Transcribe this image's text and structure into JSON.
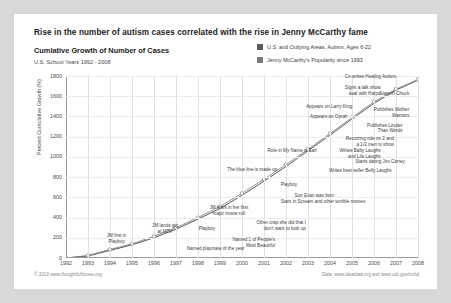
{
  "header": {
    "title": "Rise in the number of autism cases correlated with the rise in Jenny McCarthy fame",
    "subtitle": "Cumlative Growth of Number of Cases",
    "subsubtitle": "U.S. School Years 1992 - 2008"
  },
  "footer": {
    "left": "© 2013 www.thoughtfulhouse.org",
    "right": "Data: www.ideadata.org and www.cdc.gov/ncbd"
  },
  "colors": {
    "series_autism": "#5a5a5a",
    "series_mccarthy": "#7a7a7a",
    "grid": "#e2e2e2",
    "axis": "#9a9a9a",
    "card": "#ffffff",
    "page": "#d8d8d8",
    "text": "#1b1b1b"
  },
  "chart_data": {
    "type": "line",
    "title": "Rise in the number of autism cases correlated with the rise in Jenny McCarthy fame",
    "xlabel": "",
    "ylabel": "Percent Cumulative Growth (%)",
    "xlim": [
      1992,
      2008
    ],
    "ylim": [
      0,
      1800
    ],
    "yticks": [
      0,
      200,
      400,
      600,
      800,
      1000,
      1200,
      1400,
      1600,
      1800
    ],
    "ytick_labels": [
      "0",
      "200",
      "400",
      "600",
      "800",
      "1000",
      "1200",
      "1400",
      "1600",
      "1800"
    ],
    "grid": true,
    "legend_position": "top-right",
    "x": [
      1992,
      1993,
      1994,
      1995,
      1996,
      1997,
      1998,
      1999,
      2000,
      2001,
      2002,
      2003,
      2004,
      2005,
      2006,
      2007,
      2008
    ],
    "series": [
      {
        "name": "U.S. and Outlying  Areas, Autism, Ages 6-22",
        "values": [
          0,
          20,
          75,
          130,
          200,
          285,
          385,
          490,
          620,
          760,
          905,
          1060,
          1215,
          1375,
          1530,
          1660,
          1760
        ]
      },
      {
        "name": "Jenny McCarthy's Popularity since 1993",
        "values": [
          0,
          25,
          85,
          140,
          215,
          300,
          400,
          510,
          640,
          780,
          925,
          1075,
          1230,
          1390,
          1545,
          1670,
          1765
        ]
      }
    ],
    "annotations": [
      {
        "text": "Co-writes Healing Autism",
        "x": 2007.0,
        "y": 1775
      },
      {
        "text": "Signs a talk show\ndeal with Harpo",
        "x": 2006.3,
        "y": 1660
      },
      {
        "text": "Stars in Chuck",
        "x": 2007.6,
        "y": 1600
      },
      {
        "text": "Appears on Larry King",
        "x": 2005.0,
        "y": 1470
      },
      {
        "text": "Publishes Mother\nWarriors",
        "x": 2007.6,
        "y": 1440
      },
      {
        "text": "Appears on Oprah",
        "x": 2004.8,
        "y": 1370
      },
      {
        "text": "Publishes Louder\nThan Words",
        "x": 2007.3,
        "y": 1290
      },
      {
        "text": "Recurring role on 2 and\na 1/2 men tv show",
        "x": 2006.9,
        "y": 1160
      },
      {
        "text": "Role in My Name is Earl",
        "x": 2003.4,
        "y": 1040
      },
      {
        "text": "Writes Baby Laughs\nand Life Laughs",
        "x": 2006.3,
        "y": 1040
      },
      {
        "text": "Starts dating Jim Carrey",
        "x": 2007.4,
        "y": 930
      },
      {
        "text": "The blue line is made up",
        "x": 2001.6,
        "y": 855
      },
      {
        "text": "Writes best seller Belly Laughs",
        "x": 2006.8,
        "y": 840
      },
      {
        "text": "Playboy",
        "x": 2002.5,
        "y": 700
      },
      {
        "text": "Son Evan was born",
        "x": 2004.2,
        "y": 595
      },
      {
        "text": "Stars in Scream and other terrible movies",
        "x": 2005.6,
        "y": 530
      },
      {
        "text": "JM stars in her first\nmajor movie roll",
        "x": 1999.4,
        "y": 470
      },
      {
        "text": "Other crap she did that I\ndon't want to look up",
        "x": 2002.9,
        "y": 330
      },
      {
        "text": "JM lands gig\nat MTV",
        "x": 1996.5,
        "y": 300
      },
      {
        "text": "Playboy",
        "x": 1998.4,
        "y": 265
      },
      {
        "text": "JM first in\nPlayboy",
        "x": 1994.3,
        "y": 200
      },
      {
        "text": "Named 1 of People's\nMost Beautiful",
        "x": 2001.5,
        "y": 155
      },
      {
        "text": "Named playmate of the year",
        "x": 1998.8,
        "y": 70
      }
    ]
  },
  "legend": [
    {
      "label": "U.S. and Outlying  Areas, Autism, Ages 6-22",
      "color": "#5a5a5a"
    },
    {
      "label": "Jenny McCarthy's Popularity since 1993",
      "color": "#7a7a7a"
    }
  ]
}
